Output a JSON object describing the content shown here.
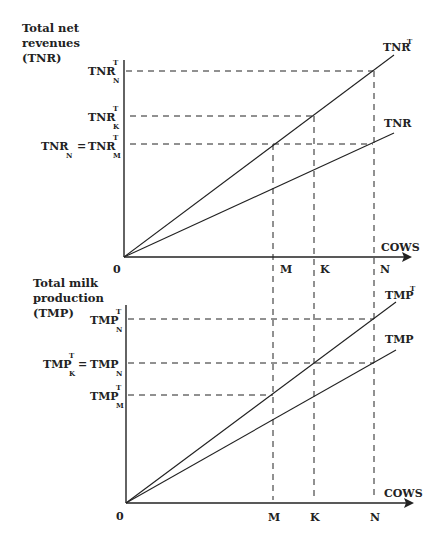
{
  "top_panel": {
    "title_lines": [
      "Total net",
      "revenues",
      "(TNR)"
    ],
    "origin_label": "0",
    "x_axis_label": "COWS",
    "x_ticks": [
      "M",
      "K",
      "N"
    ],
    "y_labels": {
      "tnr_t_n": {
        "main": "TNR",
        "sup": "T",
        "sub": "N"
      },
      "tnr_t_k": {
        "main": "TNR",
        "sup": "T",
        "sub": "K"
      },
      "tnr_n_eq": {
        "left_main": "TNR",
        "left_sub": "N",
        "eq": "=",
        "right_main": "TNR",
        "right_sup": "T",
        "right_sub": "M"
      }
    },
    "curves": {
      "upper": {
        "main": "TNR",
        "sup": "T"
      },
      "lower": {
        "main": "TNR"
      }
    }
  },
  "bottom_panel": {
    "title_lines": [
      "Total milk",
      "production",
      "(TMP)"
    ],
    "origin_label": "0",
    "x_axis_label": "COWS",
    "x_ticks": [
      "M",
      "K",
      "N"
    ],
    "y_labels": {
      "tmp_t_n": {
        "main": "TMP",
        "sup": "T",
        "sub": "N"
      },
      "tmp_k_eq": {
        "left_main": "TMP",
        "left_sup": "T",
        "left_sub": "K",
        "eq": "=",
        "right_main": "TMP",
        "right_sub": "N"
      },
      "tmp_t_m": {
        "main": "TMP",
        "sup": "T",
        "sub": "M"
      }
    },
    "curves": {
      "upper": {
        "main": "TMP",
        "sup": "T"
      },
      "lower": {
        "main": "TMP"
      }
    }
  }
}
